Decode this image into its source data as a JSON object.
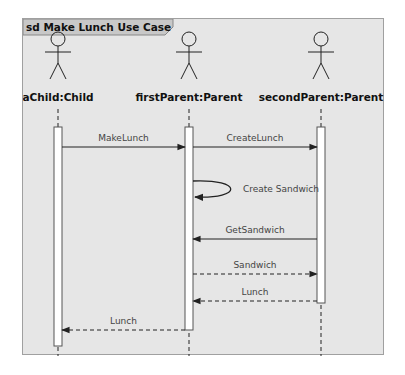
{
  "frame": {
    "title": "sd Make Lunch Use Case"
  },
  "lifelines": [
    {
      "id": "child",
      "name": "aChild:Child"
    },
    {
      "id": "first",
      "name": "firstParent:Parent"
    },
    {
      "id": "second",
      "name": "secondParent:Parent"
    }
  ],
  "messages": [
    {
      "label": "MakeLunch",
      "from": "child",
      "to": "first",
      "kind": "sync"
    },
    {
      "label": "CreateLunch",
      "from": "first",
      "to": "second",
      "kind": "sync"
    },
    {
      "label": "Create Sandwich",
      "from": "first",
      "to": "first",
      "kind": "self"
    },
    {
      "label": "GetSandwich",
      "from": "second",
      "to": "first",
      "kind": "sync"
    },
    {
      "label": "Sandwich",
      "from": "first",
      "to": "second",
      "kind": "return"
    },
    {
      "label": "Lunch",
      "from": "second",
      "to": "first",
      "kind": "return"
    },
    {
      "label": "Lunch",
      "from": "first",
      "to": "child",
      "kind": "return"
    }
  ],
  "colors": {
    "frame_bg": "#e6e6e6",
    "line": "#222222",
    "activation": "#ffffff"
  }
}
